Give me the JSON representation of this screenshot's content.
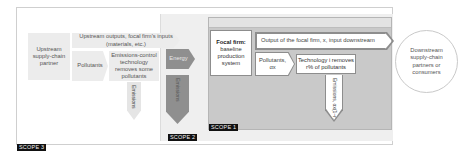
{
  "diagram": {
    "scopes": {
      "scope3": {
        "label": "SCOPE 3"
      },
      "scope2": {
        "label": "SCOPE 2"
      },
      "scope1": {
        "label": "SCOPE 1"
      }
    },
    "nodes": {
      "upstream_partner": "Upstream supply-chain partner",
      "upstream_outputs": "Upstream outputs, focal firm's inputs (materials, etc.)",
      "pollutants_upstream": "Pollutants",
      "emissions_control": "Emissions-control technology removes some pollutants",
      "emissions_upstream": "Emissions",
      "energy": "Energy",
      "emissions_scope2": "Emissions",
      "focal_firm_title": "Focal firm:",
      "focal_firm_desc": "baseline production system",
      "output_focal": "Output of the focal firm, x, input downstream",
      "pollutants_scope1": "Pollutants, αx",
      "technology_i": "Technology i removes r% of pollutants",
      "emissions_scope1": "Emissions, αx(1−r)",
      "downstream": "Downstream supply-chain partners or consumers"
    },
    "colors": {
      "scope3_bg": "#ffffff",
      "scope2_bg": "#efefef",
      "scope1_bg": "#c9c9c9",
      "dark_arrow": "#8f8f8f",
      "light_box": "#ececec",
      "tag_bg": "#111111"
    }
  }
}
